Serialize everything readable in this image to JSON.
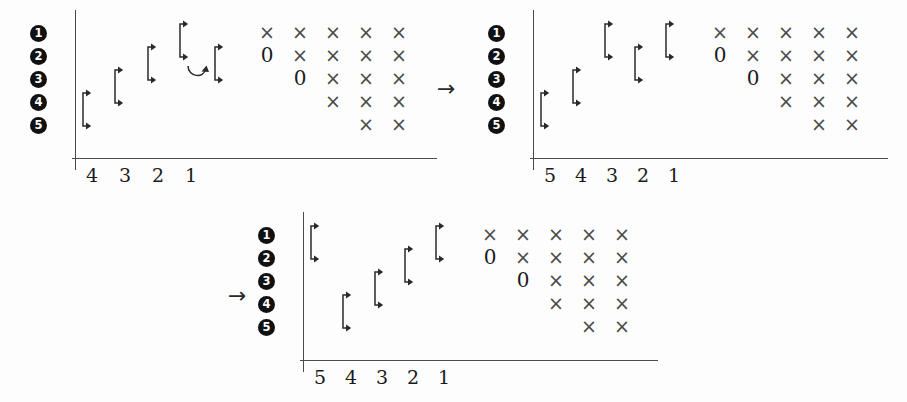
{
  "figure": {
    "background_color": "#fdfdfd",
    "ink_color": "#1a1a1a",
    "axis_color": "#4a4a4a",
    "badge_fill": "#111111",
    "badge_text_color": "#ffffff"
  },
  "row_labels": [
    "1",
    "2",
    "3",
    "4",
    "5"
  ],
  "glyphs": {
    "cross": "×",
    "zero": "0",
    "transition_arrow": "→",
    "connector_icon": "bracket-double-arrow-icon",
    "rotate_icon": "curved-rotate-arrow-icon"
  },
  "transitions": [
    {
      "label": "→",
      "name": "transition-arrow-1"
    },
    {
      "label": "→",
      "name": "transition-arrow-2"
    }
  ],
  "panels": [
    {
      "id": "panel-1",
      "name": "diagram-panel-1",
      "column_labels": [
        "4",
        "3",
        "2",
        "1"
      ],
      "grid": [
        [
          "×",
          "×",
          "×",
          "×",
          "×"
        ],
        [
          "0",
          "×",
          "×",
          "×",
          "×"
        ],
        [
          "",
          "0",
          "×",
          "×",
          "×"
        ],
        [
          "",
          "",
          "×",
          "×",
          "×"
        ],
        [
          "",
          "",
          "",
          "×",
          "×"
        ]
      ],
      "connectors": [
        {
          "name": "connector-c4-r4r5",
          "column": 4,
          "top_row": 4,
          "bottom_row": 5
        },
        {
          "name": "connector-c3-r3r4",
          "column": 3,
          "top_row": 3,
          "bottom_row": 4
        },
        {
          "name": "connector-c2-r2r3",
          "column": 2,
          "top_row": 2,
          "bottom_row": 3
        },
        {
          "name": "connector-c1b-r1r2",
          "column": "1b",
          "top_row": 1,
          "bottom_row": 2
        },
        {
          "name": "connector-c1-r2r3",
          "column": 1,
          "top_row": 2,
          "bottom_row": 3
        }
      ],
      "rotate_markers": [
        {
          "name": "rotate-marker-r3",
          "row": 3
        }
      ]
    },
    {
      "id": "panel-2",
      "name": "diagram-panel-2",
      "column_labels": [
        "5",
        "4",
        "3",
        "2",
        "1"
      ],
      "grid": [
        [
          "×",
          "×",
          "×",
          "×",
          "×"
        ],
        [
          "0",
          "×",
          "×",
          "×",
          "×"
        ],
        [
          "",
          "0",
          "×",
          "×",
          "×"
        ],
        [
          "",
          "",
          "×",
          "×",
          "×"
        ],
        [
          "",
          "",
          "",
          "×",
          "×"
        ]
      ],
      "connectors": [
        {
          "name": "connector-c5-r4r5",
          "column": 5,
          "top_row": 4,
          "bottom_row": 5
        },
        {
          "name": "connector-c4-r3r4",
          "column": 4,
          "top_row": 3,
          "bottom_row": 4
        },
        {
          "name": "connector-c3-r1r2",
          "column": 3,
          "top_row": 1,
          "bottom_row": 2
        },
        {
          "name": "connector-c2-r2r3",
          "column": 2,
          "top_row": 2,
          "bottom_row": 3
        },
        {
          "name": "connector-c1-r1r2",
          "column": 1,
          "top_row": 1,
          "bottom_row": 2
        }
      ],
      "rotate_markers": []
    },
    {
      "id": "panel-3",
      "name": "diagram-panel-3",
      "column_labels": [
        "5",
        "4",
        "3",
        "2",
        "1"
      ],
      "grid": [
        [
          "×",
          "×",
          "×",
          "×",
          "×"
        ],
        [
          "0",
          "×",
          "×",
          "×",
          "×"
        ],
        [
          "",
          "0",
          "×",
          "×",
          "×"
        ],
        [
          "",
          "",
          "×",
          "×",
          "×"
        ],
        [
          "",
          "",
          "",
          "×",
          "×"
        ]
      ],
      "connectors": [
        {
          "name": "connector-c5-r1r2",
          "column": 5,
          "top_row": 1,
          "bottom_row": 2
        },
        {
          "name": "connector-c4-r4r5",
          "column": 4,
          "top_row": 4,
          "bottom_row": 5
        },
        {
          "name": "connector-c3-r3r4",
          "column": 3,
          "top_row": 3,
          "bottom_row": 4
        },
        {
          "name": "connector-c2-r2r3",
          "column": 2,
          "top_row": 2,
          "bottom_row": 3
        },
        {
          "name": "connector-c1-r1r2",
          "column": 1,
          "top_row": 1,
          "bottom_row": 2
        }
      ],
      "rotate_markers": []
    }
  ]
}
